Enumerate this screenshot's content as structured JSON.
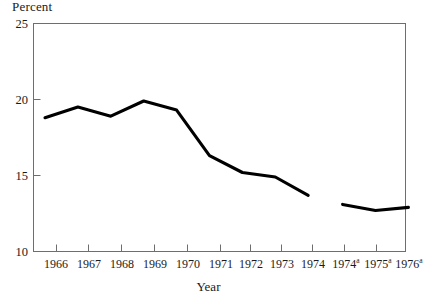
{
  "chart_data": {
    "type": "line",
    "title": "",
    "ylabel": "Percent",
    "xlabel": "Year",
    "ylim": [
      10,
      25
    ],
    "yticks": [
      10,
      15,
      20,
      25
    ],
    "ytick_labels": [
      "10",
      "15",
      "20",
      "25"
    ],
    "grid": false,
    "legend": null,
    "categories": [
      "1966",
      "1967",
      "1968",
      "1969",
      "1970",
      "1971",
      "1972",
      "1973",
      "1974",
      "1974a",
      "1975a",
      "1976a"
    ],
    "xtick_labels": [
      {
        "text": "1966",
        "sup": ""
      },
      {
        "text": "1967",
        "sup": ""
      },
      {
        "text": "1968",
        "sup": ""
      },
      {
        "text": "1969",
        "sup": ""
      },
      {
        "text": "1970",
        "sup": ""
      },
      {
        "text": "1971",
        "sup": ""
      },
      {
        "text": "1972",
        "sup": ""
      },
      {
        "text": "1973",
        "sup": ""
      },
      {
        "text": "1974",
        "sup": ""
      },
      {
        "text": "1974",
        "sup": "a"
      },
      {
        "text": "1975",
        "sup": "a"
      },
      {
        "text": "1976",
        "sup": "a"
      }
    ],
    "series": [
      {
        "name": "Percent (1966-1974)",
        "x": [
          "1966",
          "1967",
          "1968",
          "1969",
          "1970",
          "1971",
          "1972",
          "1973",
          "1974"
        ],
        "values": [
          18.8,
          19.5,
          18.9,
          19.9,
          19.3,
          16.3,
          15.2,
          14.9,
          13.7
        ],
        "color": "#000000"
      },
      {
        "name": "Percent (1974a-1976a)",
        "x": [
          "1974a",
          "1975a",
          "1976a"
        ],
        "values": [
          13.1,
          12.7,
          12.9
        ],
        "color": "#000000"
      }
    ],
    "note": "Series is broken between 1974 and 1974a; superscript a denotes revised basis."
  },
  "axes": {
    "frame_color": "#6e6e6e",
    "line_color": "#000000"
  }
}
